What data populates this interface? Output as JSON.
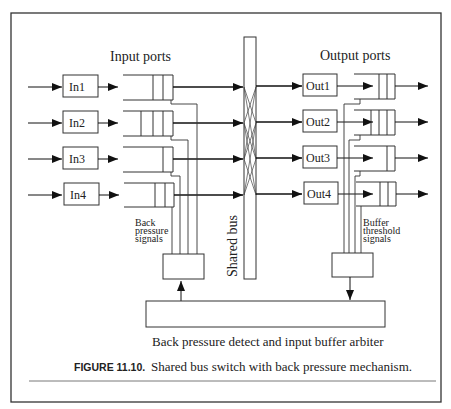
{
  "figure": {
    "caption_label": "FIGURE 11.10.",
    "caption_text": "Shared bus switch with back pressure mechanism."
  },
  "diagram": {
    "input_title": "Input ports",
    "output_title": "Output ports",
    "inputs": [
      "In1",
      "In2",
      "In3",
      "In4"
    ],
    "outputs": [
      "Out1",
      "Out2",
      "Out3",
      "Out4"
    ],
    "bus_label": "Shared bus",
    "back_pressure_label": [
      "Back",
      "pressure",
      "signals"
    ],
    "buffer_threshold_label": [
      "Buffer",
      "threshold",
      "signals"
    ],
    "arbiter_label": "Back pressure detect and input buffer arbiter"
  },
  "colors": {
    "stroke": "#222222",
    "frame": "#333333",
    "background": "#ffffff"
  }
}
